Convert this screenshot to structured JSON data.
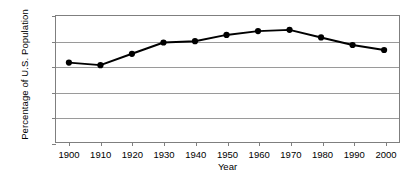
{
  "chart_data": {
    "type": "line",
    "title": "",
    "xlabel": "Year",
    "ylabel": "Percentage of U.S. Population",
    "categories": [
      1900,
      1910,
      1920,
      1930,
      1940,
      1950,
      1960,
      1970,
      1980,
      1990,
      2000
    ],
    "x_tick_labels": [
      "1900",
      "1910",
      "1920",
      "1930",
      "1940",
      "1950",
      "1960",
      "1970",
      "1980",
      "1990",
      "2000"
    ],
    "y_tick_labels": [
      "0%",
      "1%",
      "2%",
      "3%",
      "4%",
      "5%"
    ],
    "y_tick_values": [
      0,
      1,
      2,
      3,
      4,
      5
    ],
    "values": [
      3.15,
      3.05,
      3.5,
      3.95,
      4.0,
      4.25,
      4.4,
      4.45,
      4.15,
      3.85,
      3.65
    ],
    "xlim": [
      1895,
      2005
    ],
    "ylim": [
      0,
      5
    ],
    "grid": true,
    "legend": null,
    "series": [
      {
        "name": "Percentage of U.S. Population",
        "values": [
          3.15,
          3.05,
          3.5,
          3.95,
          4.0,
          4.25,
          4.4,
          4.45,
          4.15,
          3.85,
          3.65
        ],
        "color": "#000000",
        "marker": "circle",
        "marker_size": 5,
        "line_width": 2
      }
    ],
    "colors": {
      "line": "#000000",
      "marker": "#000000",
      "grid": "#9a9a9a",
      "axis": "#7f7f7f",
      "background": "#ffffff",
      "text": "#000000"
    }
  }
}
